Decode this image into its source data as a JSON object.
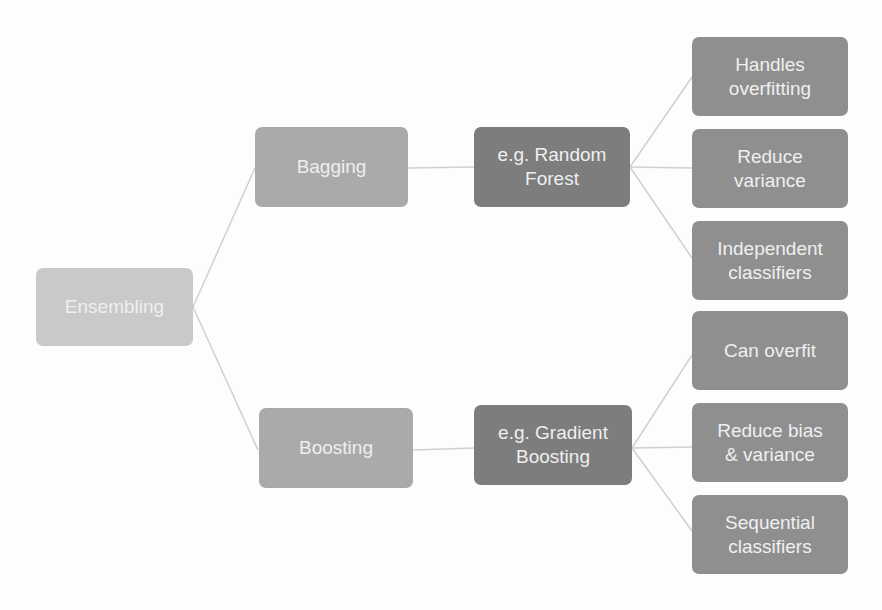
{
  "diagram": {
    "root": {
      "label": "Ensembling"
    },
    "branches": [
      {
        "label": "Bagging",
        "example": "e.g. Random\nForest",
        "properties": [
          "Handles\noverfitting",
          "Reduce\nvariance",
          "Independent\nclassifiers"
        ]
      },
      {
        "label": "Boosting",
        "example": "e.g. Gradient\nBoosting",
        "properties": [
          "Can overfit",
          "Reduce bias\n& variance",
          "Sequential\nclassifiers"
        ]
      }
    ],
    "colors": {
      "root": "#c9c9c9",
      "method": "#aaaaaa",
      "example": "#7d7d7d",
      "property": "#8f8f8f",
      "text": "#efefef",
      "connector": "#d0d0d0"
    }
  }
}
